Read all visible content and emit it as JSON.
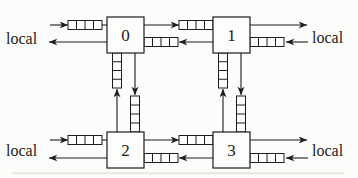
{
  "figure": {
    "type": "network-diagram",
    "colors": {
      "background": "#fcfcfa",
      "line": "#1c1c1c",
      "box_fill": "#fdfdfc",
      "artifact": "#c2c2bb"
    },
    "font": {
      "node_size": 17,
      "label_size": 16
    },
    "nodes": [
      {
        "name": "router-0",
        "label": "0",
        "x": 107,
        "y": 17,
        "w": 37,
        "h": 36
      },
      {
        "name": "router-1",
        "label": "1",
        "x": 213,
        "y": 17,
        "w": 37,
        "h": 36
      },
      {
        "name": "router-2",
        "label": "2",
        "x": 107,
        "y": 132,
        "w": 37,
        "h": 36
      },
      {
        "name": "router-3",
        "label": "3",
        "x": 213,
        "y": 132,
        "w": 37,
        "h": 36
      }
    ],
    "local_labels": [
      {
        "name": "local-label-top-left",
        "text": "local",
        "x": 6,
        "y": 44
      },
      {
        "name": "local-label-top-right",
        "text": "local",
        "x": 312,
        "y": 43
      },
      {
        "name": "local-label-bottom-left",
        "text": "local",
        "x": 6,
        "y": 156
      },
      {
        "name": "local-label-bottom-right",
        "text": "local",
        "x": 312,
        "y": 156
      }
    ],
    "arrows": [
      {
        "name": "arrow-local-to-0",
        "x1": 50,
        "y1": 25,
        "x2": 68,
        "y2": 25
      },
      {
        "name": "arrow-0-to-local",
        "x1": 107,
        "y1": 42,
        "x2": 49,
        "y2": 42
      },
      {
        "name": "arrow-1-to-local",
        "x1": 250,
        "y1": 25,
        "x2": 307,
        "y2": 25
      },
      {
        "name": "arrow-local-to-1",
        "x1": 308,
        "y1": 42,
        "x2": 286,
        "y2": 42
      },
      {
        "name": "arrow-local-to-2",
        "x1": 50,
        "y1": 140,
        "x2": 68,
        "y2": 140
      },
      {
        "name": "arrow-2-to-local",
        "x1": 107,
        "y1": 158,
        "x2": 49,
        "y2": 158
      },
      {
        "name": "arrow-3-to-local",
        "x1": 250,
        "y1": 140,
        "x2": 307,
        "y2": 140
      },
      {
        "name": "arrow-local-to-3",
        "x1": 308,
        "y1": 158,
        "x2": 286,
        "y2": 158
      },
      {
        "name": "arrow-0-to-1",
        "x1": 144,
        "y1": 25,
        "x2": 179,
        "y2": 25
      },
      {
        "name": "arrow-1-to-0",
        "x1": 213,
        "y1": 42,
        "x2": 179,
        "y2": 42
      },
      {
        "name": "arrow-2-to-3",
        "x1": 144,
        "y1": 140,
        "x2": 179,
        "y2": 140
      },
      {
        "name": "arrow-3-to-2",
        "x1": 213,
        "y1": 158,
        "x2": 179,
        "y2": 158
      },
      {
        "name": "arrow-0-to-2",
        "x1": 135,
        "y1": 53,
        "x2": 135,
        "y2": 95
      },
      {
        "name": "arrow-2-to-0",
        "x1": 117,
        "y1": 132,
        "x2": 117,
        "y2": 89
      },
      {
        "name": "arrow-1-to-3",
        "x1": 241,
        "y1": 53,
        "x2": 241,
        "y2": 95
      },
      {
        "name": "arrow-3-to-1",
        "x1": 223,
        "y1": 132,
        "x2": 223,
        "y2": 89
      }
    ],
    "connectors": [
      {
        "name": "connector-buffer-to-0",
        "x1": 102,
        "y1": 25,
        "x2": 107,
        "y2": 25
      },
      {
        "name": "connector-buffer-to-2",
        "x1": 102,
        "y1": 140,
        "x2": 107,
        "y2": 140
      }
    ],
    "buffers": [
      {
        "name": "buffer-west-input-0",
        "x": 68,
        "y": 20.5,
        "w": 34,
        "h": 9,
        "cells": 4,
        "dir": "h"
      },
      {
        "name": "buffer-east-input-0",
        "x": 144,
        "y": 37.5,
        "w": 34,
        "h": 9,
        "cells": 4,
        "dir": "h"
      },
      {
        "name": "buffer-west-input-1",
        "x": 179,
        "y": 20.5,
        "w": 34,
        "h": 9,
        "cells": 4,
        "dir": "h"
      },
      {
        "name": "buffer-east-input-1",
        "x": 250,
        "y": 37.5,
        "w": 34,
        "h": 9,
        "cells": 4,
        "dir": "h"
      },
      {
        "name": "buffer-west-input-2",
        "x": 68,
        "y": 135.5,
        "w": 34,
        "h": 9,
        "cells": 4,
        "dir": "h"
      },
      {
        "name": "buffer-east-input-2",
        "x": 144,
        "y": 153.5,
        "w": 34,
        "h": 9,
        "cells": 4,
        "dir": "h"
      },
      {
        "name": "buffer-west-input-3",
        "x": 179,
        "y": 135.5,
        "w": 34,
        "h": 9,
        "cells": 4,
        "dir": "h"
      },
      {
        "name": "buffer-east-input-3",
        "x": 250,
        "y": 153.5,
        "w": 34,
        "h": 9,
        "cells": 4,
        "dir": "h"
      },
      {
        "name": "buffer-south-input-0",
        "x": 112.5,
        "y": 53,
        "w": 9,
        "h": 35,
        "cells": 4,
        "dir": "v"
      },
      {
        "name": "buffer-north-input-2",
        "x": 130.5,
        "y": 96,
        "w": 9,
        "h": 36,
        "cells": 4,
        "dir": "v"
      },
      {
        "name": "buffer-south-input-1",
        "x": 218.5,
        "y": 53,
        "w": 9,
        "h": 35,
        "cells": 4,
        "dir": "v"
      },
      {
        "name": "buffer-north-input-3",
        "x": 236.5,
        "y": 96,
        "w": 9,
        "h": 36,
        "cells": 4,
        "dir": "v"
      }
    ],
    "artifact": {
      "name": "scan-artifact",
      "x": 12,
      "y": 172.2,
      "w": 332,
      "h": 2,
      "opacity": 0.38
    }
  }
}
